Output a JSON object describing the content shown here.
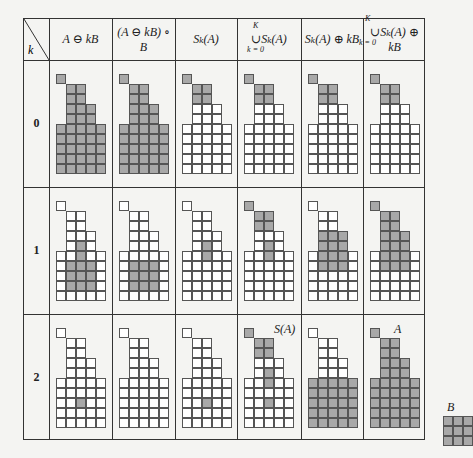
{
  "header": {
    "k_label": "k",
    "columns": [
      "A ⊖ kB",
      "(A ⊖ kB) ∘ B",
      "S_k(A)",
      "∪ S_k(A), k=0..K",
      "S_k(A) ⊕ kB",
      "∪ S_k(A) ⊕ kB, k=0..K"
    ],
    "col_display": [
      "A ⊖ kB",
      "(A ⊖ kB) ∘ B",
      "Sₖ(A)",
      "∪Sₖ(A)",
      "Sₖ(A) ⊕ kB",
      "∪Sₖ(A) ⊕ kB"
    ],
    "union_top": "K",
    "union_bottom": "k = 0"
  },
  "rows": [
    {
      "k": "0",
      "cells": [
        "all",
        "all",
        [
          [
            0,
            0
          ],
          [
            1,
            1
          ],
          [
            1,
            2
          ],
          [
            2,
            1
          ],
          [
            2,
            2
          ]
        ],
        [
          [
            0,
            0
          ],
          [
            1,
            1
          ],
          [
            1,
            2
          ],
          [
            2,
            1
          ],
          [
            2,
            2
          ]
        ],
        [
          [
            0,
            0
          ],
          [
            1,
            1
          ],
          [
            1,
            2
          ],
          [
            2,
            1
          ],
          [
            2,
            2
          ]
        ],
        [
          [
            0,
            0
          ],
          [
            1,
            1
          ],
          [
            1,
            2
          ],
          [
            2,
            1
          ],
          [
            2,
            2
          ]
        ]
      ]
    },
    {
      "k": "1",
      "cells": [
        [
          [
            4,
            2
          ],
          [
            5,
            2
          ],
          [
            6,
            1
          ],
          [
            6,
            2
          ],
          [
            6,
            3
          ],
          [
            7,
            1
          ],
          [
            7,
            2
          ],
          [
            7,
            3
          ],
          [
            8,
            1
          ],
          [
            8,
            2
          ],
          [
            8,
            3
          ]
        ],
        [
          [
            6,
            1
          ],
          [
            6,
            2
          ],
          [
            6,
            3
          ],
          [
            7,
            1
          ],
          [
            7,
            2
          ],
          [
            7,
            3
          ],
          [
            8,
            1
          ],
          [
            8,
            2
          ],
          [
            8,
            3
          ]
        ],
        [
          [
            4,
            2
          ],
          [
            5,
            2
          ]
        ],
        [
          [
            0,
            0
          ],
          [
            1,
            1
          ],
          [
            1,
            2
          ],
          [
            2,
            1
          ],
          [
            2,
            2
          ],
          [
            4,
            2
          ],
          [
            5,
            2
          ]
        ],
        [
          [
            3,
            1
          ],
          [
            3,
            2
          ],
          [
            3,
            3
          ],
          [
            4,
            1
          ],
          [
            4,
            2
          ],
          [
            4,
            3
          ],
          [
            5,
            1
          ],
          [
            5,
            2
          ],
          [
            5,
            3
          ],
          [
            6,
            1
          ],
          [
            6,
            2
          ],
          [
            6,
            3
          ]
        ],
        [
          [
            0,
            0
          ],
          [
            1,
            1
          ],
          [
            1,
            2
          ],
          [
            2,
            1
          ],
          [
            2,
            2
          ],
          [
            3,
            1
          ],
          [
            3,
            2
          ],
          [
            3,
            3
          ],
          [
            4,
            1
          ],
          [
            4,
            2
          ],
          [
            4,
            3
          ],
          [
            5,
            1
          ],
          [
            5,
            2
          ],
          [
            5,
            3
          ],
          [
            6,
            1
          ],
          [
            6,
            2
          ],
          [
            6,
            3
          ]
        ]
      ]
    },
    {
      "k": "2",
      "cells": [
        [
          [
            7,
            2
          ]
        ],
        [],
        [
          [
            7,
            2
          ]
        ],
        [
          [
            0,
            0
          ],
          [
            1,
            1
          ],
          [
            1,
            2
          ],
          [
            2,
            1
          ],
          [
            2,
            2
          ],
          [
            4,
            2
          ],
          [
            5,
            2
          ],
          [
            7,
            2
          ]
        ],
        [
          [
            5,
            0
          ],
          [
            5,
            1
          ],
          [
            5,
            2
          ],
          [
            5,
            3
          ],
          [
            5,
            4
          ],
          [
            6,
            0
          ],
          [
            6,
            1
          ],
          [
            6,
            2
          ],
          [
            6,
            3
          ],
          [
            6,
            4
          ],
          [
            7,
            0
          ],
          [
            7,
            1
          ],
          [
            7,
            2
          ],
          [
            7,
            3
          ],
          [
            7,
            4
          ],
          [
            8,
            0
          ],
          [
            8,
            1
          ],
          [
            8,
            2
          ],
          [
            8,
            3
          ],
          [
            8,
            4
          ],
          [
            9,
            0
          ],
          [
            9,
            1
          ],
          [
            9,
            2
          ],
          [
            9,
            3
          ],
          [
            9,
            4
          ]
        ],
        "all"
      ]
    }
  ],
  "annotations": {
    "s_of_a": "S(A)",
    "a": "A",
    "b": "B"
  },
  "shape": [
    [
      0,
      0
    ],
    [
      1,
      1
    ],
    [
      1,
      2
    ],
    [
      2,
      1
    ],
    [
      2,
      2
    ],
    [
      3,
      1
    ],
    [
      3,
      2
    ],
    [
      3,
      3
    ],
    [
      4,
      1
    ],
    [
      4,
      2
    ],
    [
      4,
      3
    ],
    [
      5,
      0
    ],
    [
      5,
      1
    ],
    [
      5,
      2
    ],
    [
      5,
      3
    ],
    [
      5,
      4
    ],
    [
      6,
      0
    ],
    [
      6,
      1
    ],
    [
      6,
      2
    ],
    [
      6,
      3
    ],
    [
      6,
      4
    ],
    [
      7,
      0
    ],
    [
      7,
      1
    ],
    [
      7,
      2
    ],
    [
      7,
      3
    ],
    [
      7,
      4
    ],
    [
      8,
      0
    ],
    [
      8,
      1
    ],
    [
      8,
      2
    ],
    [
      8,
      3
    ],
    [
      8,
      4
    ],
    [
      9,
      0
    ],
    [
      9,
      1
    ],
    [
      9,
      2
    ],
    [
      9,
      3
    ],
    [
      9,
      4
    ]
  ],
  "colors": {
    "fill": "#a8a8a8",
    "line": "#555555",
    "background": "#f4f4f2"
  }
}
